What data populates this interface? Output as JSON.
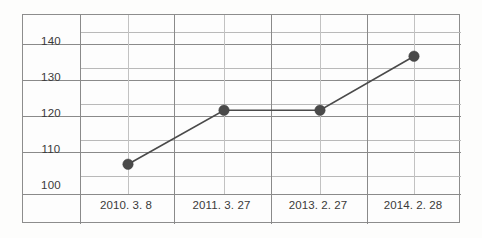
{
  "chart_data": {
    "type": "line",
    "title": "",
    "subtitle": "",
    "xlabel": "",
    "ylabel": "",
    "categories": [
      "2010. 3. 8",
      "2011. 3. 27",
      "2013. 2. 27",
      "2014. 2. 28"
    ],
    "values": [
      103,
      118,
      118,
      133
    ],
    "series": [
      {
        "name": "",
        "values": [
          103,
          118,
          118,
          133
        ]
      }
    ],
    "ytick_labels": [
      "140",
      "130",
      "120",
      "110",
      "100"
    ],
    "ytick_values": [
      140,
      130,
      120,
      110,
      100
    ],
    "ylim": [
      95,
      145
    ],
    "grid": true,
    "legend": false,
    "legend_position": "none",
    "marker": "filled-circle",
    "line_color": "#4a4a4a",
    "marker_color": "#4a4a4a",
    "grid_color": "#b9b9b9",
    "frame_color": "#8a8a8a",
    "background_color": "#fdfdfd",
    "text_color": "#3a3a3a"
  },
  "axis": {
    "y": {
      "ticks": [
        {
          "label": "140"
        },
        {
          "label": "130"
        },
        {
          "label": "120"
        },
        {
          "label": "110"
        },
        {
          "label": "100"
        }
      ]
    },
    "x": {
      "ticks": [
        {
          "label": "2010. 3. 8"
        },
        {
          "label": "2011. 3. 27"
        },
        {
          "label": "2013. 2. 27"
        },
        {
          "label": "2014. 2. 28"
        }
      ]
    }
  }
}
